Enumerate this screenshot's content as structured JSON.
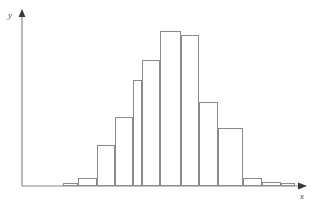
{
  "figure": {
    "kind": "histogram-figure",
    "width": 329,
    "height": 208,
    "background": "#ffffff"
  },
  "axes": {
    "x_label": "x",
    "y_label": "y",
    "axis_color": "#8a8a8a",
    "arrow_color": "#3a3a3a",
    "origin_x": 22,
    "baseline_y": 186,
    "y_axis_top": 12,
    "x_axis_right": 307
  },
  "bars": {
    "stroke_color": "#8a8a8a",
    "fill_color": "#ffffff",
    "stroke_width": 1
  },
  "chart_data": {
    "type": "bar",
    "title": "",
    "subtitle": "",
    "xlabel": "x",
    "ylabel": "y",
    "grid": false,
    "legend": "none",
    "axis_ticks": false,
    "tick_labels": [],
    "bin_edges": [
      63,
      78,
      97,
      115,
      133,
      142,
      160,
      181,
      199,
      218,
      243,
      262,
      281,
      295
    ],
    "categories": [
      "1",
      "2",
      "3",
      "4",
      "5",
      "6",
      "7",
      "8",
      "9",
      "10",
      "11",
      "12",
      "13"
    ],
    "values": [
      3,
      8,
      41,
      69,
      106,
      126,
      155,
      151,
      84,
      58,
      8,
      4,
      3
    ],
    "bar_tops_y": [
      183,
      178,
      145,
      117,
      80,
      60,
      31,
      35,
      102,
      128,
      178,
      182,
      183
    ],
    "bar_left_x": [
      63,
      78,
      97,
      115,
      133,
      142,
      160,
      181,
      199,
      218,
      243,
      262,
      281
    ],
    "bar_right_x": [
      78,
      97,
      115,
      133,
      142,
      160,
      181,
      199,
      218,
      243,
      262,
      281,
      295
    ],
    "ylim": [
      0,
      160
    ],
    "xlim": [
      22,
      307
    ],
    "shape": "unimodal bell-shaped distribution"
  }
}
